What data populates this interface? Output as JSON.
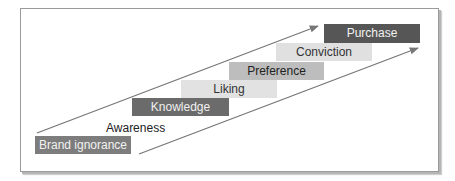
{
  "diagram": {
    "type": "hierarchy-of-effects staircase",
    "steps": [
      {
        "label": "Brand ignorance",
        "fill": "#7d7d7d",
        "text_color": "#f2f2f2",
        "box": [
          35,
          136,
          96,
          18
        ]
      },
      {
        "label": "Awareness",
        "fill": "none",
        "text_color": "#222222",
        "box": [
          106,
          121,
          54,
          14
        ]
      },
      {
        "label": "Knowledge",
        "fill": "#6b6b6b",
        "text_color": "#f0f0f0",
        "box": [
          132,
          98,
          97,
          18
        ]
      },
      {
        "label": "Liking",
        "fill": "#e2e2e2",
        "text_color": "#333333",
        "box": [
          181,
          80,
          96,
          18
        ]
      },
      {
        "label": "Preference",
        "fill": "#bdbdbd",
        "text_color": "#222222",
        "box": [
          229,
          62,
          95,
          18
        ]
      },
      {
        "label": "Conviction",
        "fill": "#e0e0e0",
        "text_color": "#333333",
        "box": [
          276,
          43,
          96,
          18
        ]
      },
      {
        "label": "Purchase",
        "fill": "#565656",
        "text_color": "#f2f2f2",
        "box": [
          324,
          24,
          96,
          19
        ]
      }
    ],
    "arrows": [
      {
        "name": "upper-arrow",
        "from": [
          37,
          133
        ],
        "to": [
          318,
          26
        ],
        "color": "#777777"
      },
      {
        "name": "lower-arrow",
        "from": [
          139,
          154
        ],
        "to": [
          418,
          48
        ],
        "color": "#777777"
      }
    ]
  }
}
